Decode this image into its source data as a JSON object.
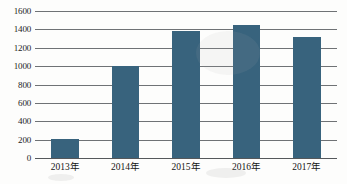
{
  "chart_data": {
    "type": "bar",
    "title": "",
    "subtitle": "",
    "xlabel": "",
    "ylabel": "",
    "categories": [
      "2013年",
      "2014年",
      "2015年",
      "2016年",
      "2017年"
    ],
    "values": [
      205,
      1000,
      1380,
      1450,
      1320
    ],
    "series": [
      {
        "name": "",
        "values": [
          205,
          1000,
          1380,
          1450,
          1320
        ]
      }
    ],
    "ylim": [
      0,
      1600
    ],
    "ytick_values": [
      0,
      200,
      400,
      600,
      800,
      1000,
      1200,
      1400,
      1600
    ],
    "ytick_labels": [
      "0",
      "200",
      "400",
      "600",
      "800",
      "1000",
      "1200",
      "1400",
      "1600"
    ],
    "xtick_labels": [
      "2013年",
      "2014年",
      "2015年",
      "2016年",
      "2017年"
    ],
    "grid": true,
    "grid_axis": "y",
    "legend": false,
    "legend_position": "none",
    "annotations": [],
    "colors": {
      "bar": "#38637d",
      "gridline": "#6f7275",
      "axis": "#55585b",
      "background": "#fdfdfc",
      "text": "#1c1c1c"
    }
  }
}
